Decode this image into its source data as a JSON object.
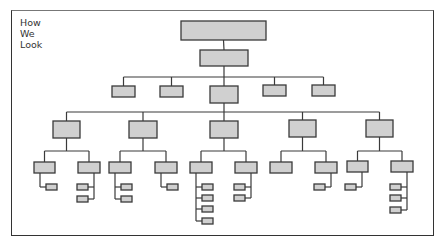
{
  "title": {
    "lines": [
      "How",
      "We",
      "Look"
    ]
  },
  "colors": {
    "box_fill": "#d0d0d0",
    "box_stroke": "#3a3a3a",
    "line": "#3a3a3a",
    "frame": "#333333"
  },
  "org_chart": {
    "nodes": [
      {
        "id": "root",
        "x": 181,
        "y": 21,
        "w": 85,
        "h": 19
      },
      {
        "id": "l2",
        "x": 200,
        "y": 50,
        "w": 48,
        "h": 16
      },
      {
        "id": "l3a",
        "x": 112,
        "y": 86,
        "w": 23,
        "h": 11
      },
      {
        "id": "l3b",
        "x": 160,
        "y": 86,
        "w": 23,
        "h": 11
      },
      {
        "id": "l3c",
        "x": 210,
        "y": 86,
        "w": 28,
        "h": 17
      },
      {
        "id": "l3d",
        "x": 263,
        "y": 85,
        "w": 23,
        "h": 11
      },
      {
        "id": "l3e",
        "x": 312,
        "y": 85,
        "w": 23,
        "h": 11
      },
      {
        "id": "l4a",
        "x": 53,
        "y": 121,
        "w": 27,
        "h": 17
      },
      {
        "id": "l4b",
        "x": 129,
        "y": 121,
        "w": 28,
        "h": 17
      },
      {
        "id": "l4c",
        "x": 210,
        "y": 121,
        "w": 28,
        "h": 17
      },
      {
        "id": "l4d",
        "x": 289,
        "y": 120,
        "w": 27,
        "h": 17
      },
      {
        "id": "l4e",
        "x": 366,
        "y": 120,
        "w": 27,
        "h": 17
      },
      {
        "id": "l5a1",
        "x": 34,
        "y": 162,
        "w": 21,
        "h": 11
      },
      {
        "id": "l5a2",
        "x": 78,
        "y": 162,
        "w": 22,
        "h": 11
      },
      {
        "id": "l5b1",
        "x": 109,
        "y": 162,
        "w": 22,
        "h": 11
      },
      {
        "id": "l5b2",
        "x": 155,
        "y": 162,
        "w": 22,
        "h": 11
      },
      {
        "id": "l5c1",
        "x": 190,
        "y": 162,
        "w": 22,
        "h": 11
      },
      {
        "id": "l5c2",
        "x": 235,
        "y": 162,
        "w": 22,
        "h": 11
      },
      {
        "id": "l5d1",
        "x": 270,
        "y": 162,
        "w": 22,
        "h": 11
      },
      {
        "id": "l5d2",
        "x": 315,
        "y": 162,
        "w": 22,
        "h": 11
      },
      {
        "id": "l5e1",
        "x": 347,
        "y": 161,
        "w": 21,
        "h": 11
      },
      {
        "id": "l5e2",
        "x": 391,
        "y": 161,
        "w": 22,
        "h": 11
      }
    ],
    "leaves": [
      {
        "parent": "l5a1",
        "side": "right",
        "ys": [
          187
        ]
      },
      {
        "parent": "l5a2",
        "side": "left",
        "ys": [
          187,
          199
        ]
      },
      {
        "parent": "l5b1",
        "side": "right",
        "ys": [
          187,
          199
        ]
      },
      {
        "parent": "l5b2",
        "side": "right",
        "ys": [
          187
        ]
      },
      {
        "parent": "l5c1",
        "side": "right",
        "ys": [
          187,
          198,
          209,
          221
        ]
      },
      {
        "parent": "l5c2",
        "side": "left",
        "ys": [
          187,
          198
        ]
      },
      {
        "parent": "l5d2",
        "side": "left",
        "ys": [
          187
        ]
      },
      {
        "parent": "l5e1",
        "side": "left",
        "ys": [
          187
        ]
      },
      {
        "parent": "l5e2",
        "side": "left",
        "ys": [
          187,
          198,
          210
        ]
      }
    ],
    "groups": [
      {
        "parent": "root",
        "children": [
          "l2"
        ]
      },
      {
        "parent": "l2",
        "children": [
          "l3a",
          "l3b",
          "l3c",
          "l3d",
          "l3e"
        ],
        "bus_y": 77
      },
      {
        "parent": "l3c",
        "children": [
          "l4a",
          "l4b",
          "l4c",
          "l4d",
          "l4e"
        ],
        "bus_y": 112
      },
      {
        "parent": "l4a",
        "children": [
          "l5a1",
          "l5a2"
        ],
        "bus_y": 151
      },
      {
        "parent": "l4b",
        "children": [
          "l5b1",
          "l5b2"
        ],
        "bus_y": 151
      },
      {
        "parent": "l4c",
        "children": [
          "l5c1",
          "l5c2"
        ],
        "bus_y": 151
      },
      {
        "parent": "l4d",
        "children": [
          "l5d1",
          "l5d2"
        ],
        "bus_y": 151
      },
      {
        "parent": "l4e",
        "children": [
          "l5e1",
          "l5e2"
        ],
        "bus_y": 151
      }
    ]
  }
}
